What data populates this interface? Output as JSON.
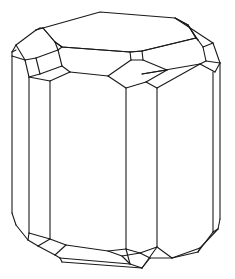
{
  "figure": {
    "type": "crystal-habit-line-drawing",
    "stroke_color": "#1a1a1a",
    "background_color": "#ffffff",
    "stroke_width": 1.1,
    "caption": ""
  },
  "geometry": {
    "top_face": [
      [
        43,
        28
      ],
      [
        100,
        12
      ],
      [
        175,
        18
      ],
      [
        188,
        25
      ],
      [
        196,
        38
      ],
      [
        142,
        51
      ],
      [
        130,
        52
      ],
      [
        62,
        47
      ],
      [
        55,
        42
      ]
    ],
    "edges": [
      [
        [
          43,
          28
        ],
        [
          36,
          30
        ]
      ],
      [
        [
          36,
          30
        ],
        [
          16,
          45
        ]
      ],
      [
        [
          16,
          45
        ],
        [
          12,
          52
        ]
      ],
      [
        [
          12,
          52
        ],
        [
          16,
          50
        ]
      ],
      [
        [
          36,
          30
        ],
        [
          40,
          28
        ]
      ],
      [
        [
          40,
          28
        ],
        [
          43,
          28
        ]
      ],
      [
        [
          43,
          28
        ],
        [
          55,
          42
        ]
      ],
      [
        [
          55,
          42
        ],
        [
          62,
          47
        ]
      ],
      [
        [
          55,
          42
        ],
        [
          58,
          50
        ]
      ],
      [
        [
          58,
          50
        ],
        [
          62,
          47
        ]
      ],
      [
        [
          62,
          47
        ],
        [
          130,
          52
        ]
      ],
      [
        [
          130,
          52
        ],
        [
          142,
          51
        ]
      ],
      [
        [
          142,
          51
        ],
        [
          196,
          38
        ]
      ],
      [
        [
          196,
          38
        ],
        [
          188,
          25
        ]
      ],
      [
        [
          188,
          25
        ],
        [
          175,
          18
        ]
      ],
      [
        [
          175,
          18
        ],
        [
          213,
          43
        ]
      ],
      [
        [
          213,
          43
        ],
        [
          220,
          63
        ]
      ],
      [
        [
          188,
          25
        ],
        [
          198,
          40
        ]
      ],
      [
        [
          198,
          40
        ],
        [
          203,
          47
        ]
      ],
      [
        [
          203,
          47
        ],
        [
          213,
          43
        ]
      ],
      [
        [
          196,
          38
        ],
        [
          198,
          40
        ]
      ],
      [
        [
          203,
          47
        ],
        [
          206,
          61
        ]
      ],
      [
        [
          206,
          61
        ],
        [
          220,
          63
        ]
      ],
      [
        [
          206,
          61
        ],
        [
          200,
          64
        ]
      ],
      [
        [
          200,
          64
        ],
        [
          215,
          72
        ]
      ],
      [
        [
          215,
          72
        ],
        [
          220,
          63
        ]
      ],
      [
        [
          200,
          64
        ],
        [
          142,
          74
        ]
      ],
      [
        [
          16,
          45
        ],
        [
          25,
          60
        ]
      ],
      [
        [
          12,
          52
        ],
        [
          12,
          56
        ]
      ],
      [
        [
          12,
          56
        ],
        [
          25,
          60
        ]
      ],
      [
        [
          25,
          60
        ],
        [
          36,
          58
        ]
      ],
      [
        [
          36,
          58
        ],
        [
          58,
          50
        ]
      ],
      [
        [
          25,
          60
        ],
        [
          29,
          77
        ]
      ],
      [
        [
          36,
          58
        ],
        [
          40,
          74
        ]
      ],
      [
        [
          40,
          74
        ],
        [
          29,
          77
        ]
      ],
      [
        [
          40,
          74
        ],
        [
          62,
          66
        ]
      ],
      [
        [
          62,
          66
        ],
        [
          58,
          50
        ]
      ],
      [
        [
          29,
          77
        ],
        [
          50,
          81
        ]
      ],
      [
        [
          50,
          81
        ],
        [
          70,
          72
        ]
      ],
      [
        [
          70,
          72
        ],
        [
          62,
          66
        ]
      ],
      [
        [
          70,
          72
        ],
        [
          108,
          76
        ]
      ],
      [
        [
          130,
          52
        ],
        [
          131,
          60
        ]
      ],
      [
        [
          142,
          51
        ],
        [
          143,
          60
        ]
      ],
      [
        [
          131,
          60
        ],
        [
          143,
          60
        ]
      ],
      [
        [
          131,
          60
        ],
        [
          108,
          76
        ]
      ],
      [
        [
          143,
          60
        ],
        [
          167,
          70
        ]
      ],
      [
        [
          108,
          76
        ],
        [
          126,
          88
        ]
      ],
      [
        [
          126,
          88
        ],
        [
          146,
          82
        ]
      ],
      [
        [
          146,
          82
        ],
        [
          167,
          70
        ]
      ],
      [
        [
          146,
          82
        ],
        [
          157,
          88
        ]
      ],
      [
        [
          157,
          88
        ],
        [
          200,
          64
        ]
      ],
      [
        [
          167,
          70
        ],
        [
          142,
          74
        ]
      ],
      [
        [
          12,
          56
        ],
        [
          12,
          213
        ]
      ],
      [
        [
          29,
          77
        ],
        [
          29,
          233
        ]
      ],
      [
        [
          50,
          81
        ],
        [
          50,
          239
        ]
      ],
      [
        [
          126,
          88
        ],
        [
          126,
          249
        ]
      ],
      [
        [
          157,
          88
        ],
        [
          157,
          247
        ]
      ],
      [
        [
          213,
          72
        ],
        [
          213,
          232
        ]
      ],
      [
        [
          220,
          63
        ],
        [
          220,
          219
        ]
      ],
      [
        [
          12,
          213
        ],
        [
          16,
          225
        ]
      ],
      [
        [
          16,
          225
        ],
        [
          28,
          240
        ]
      ],
      [
        [
          28,
          240
        ],
        [
          29,
          233
        ]
      ],
      [
        [
          29,
          233
        ],
        [
          50,
          239
        ]
      ],
      [
        [
          28,
          240
        ],
        [
          38,
          246
        ]
      ],
      [
        [
          38,
          246
        ],
        [
          50,
          239
        ]
      ],
      [
        [
          38,
          246
        ],
        [
          55,
          255
        ]
      ],
      [
        [
          50,
          239
        ],
        [
          66,
          245
        ]
      ],
      [
        [
          66,
          245
        ],
        [
          55,
          255
        ]
      ],
      [
        [
          55,
          255
        ],
        [
          60,
          258
        ]
      ],
      [
        [
          60,
          258
        ],
        [
          130,
          264
        ]
      ],
      [
        [
          66,
          245
        ],
        [
          108,
          251
        ]
      ],
      [
        [
          60,
          258
        ],
        [
          62,
          262
        ]
      ],
      [
        [
          62,
          262
        ],
        [
          142,
          268
        ]
      ],
      [
        [
          130,
          264
        ],
        [
          142,
          268
        ]
      ],
      [
        [
          130,
          264
        ],
        [
          126,
          249
        ]
      ],
      [
        [
          142,
          268
        ],
        [
          157,
          247
        ]
      ],
      [
        [
          108,
          251
        ],
        [
          126,
          249
        ]
      ],
      [
        [
          126,
          249
        ],
        [
          140,
          253
        ]
      ],
      [
        [
          140,
          253
        ],
        [
          157,
          247
        ]
      ],
      [
        [
          108,
          251
        ],
        [
          122,
          256
        ]
      ],
      [
        [
          122,
          256
        ],
        [
          140,
          253
        ]
      ],
      [
        [
          122,
          256
        ],
        [
          130,
          264
        ]
      ],
      [
        [
          140,
          253
        ],
        [
          150,
          258
        ]
      ],
      [
        [
          150,
          258
        ],
        [
          172,
          258
        ]
      ],
      [
        [
          157,
          247
        ],
        [
          172,
          258
        ]
      ],
      [
        [
          150,
          258
        ],
        [
          142,
          268
        ]
      ],
      [
        [
          172,
          258
        ],
        [
          198,
          252
        ]
      ],
      [
        [
          213,
          232
        ],
        [
          198,
          252
        ]
      ],
      [
        [
          220,
          219
        ],
        [
          218,
          229
        ]
      ],
      [
        [
          218,
          229
        ],
        [
          200,
          248
        ]
      ],
      [
        [
          200,
          248
        ],
        [
          198,
          252
        ]
      ],
      [
        [
          213,
          232
        ],
        [
          218,
          229
        ]
      ],
      [
        [
          200,
          248
        ],
        [
          172,
          258
        ]
      ]
    ]
  }
}
